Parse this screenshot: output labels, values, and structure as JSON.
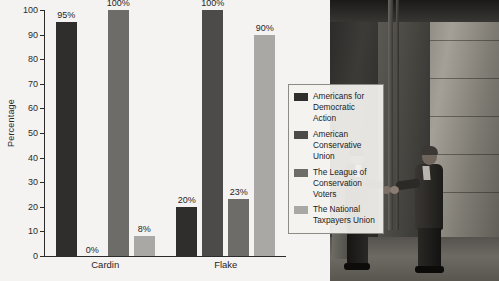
{
  "chart_data": {
    "type": "bar",
    "title": "",
    "xlabel": "",
    "ylabel": "Percentage",
    "ylim": [
      0,
      100
    ],
    "yticks": [
      0,
      10,
      20,
      30,
      40,
      50,
      60,
      70,
      80,
      90,
      100
    ],
    "grid": false,
    "legend_position": "right",
    "categories": [
      "Cardin",
      "Flake"
    ],
    "series": [
      {
        "name": "Americans for Democratic Action",
        "values": [
          95,
          20
        ],
        "labels": [
          "95%",
          "20%"
        ],
        "color": "#2f2e2c"
      },
      {
        "name": "American Conservative Union",
        "values": [
          0,
          100
        ],
        "labels": [
          "0%",
          "100%"
        ],
        "color": "#4c4b49"
      },
      {
        "name": "The League of Conservation Voters",
        "values": [
          100,
          23
        ],
        "labels": [
          "100%",
          "23%"
        ],
        "color": "#6d6c69"
      },
      {
        "name": "The National Taxpayers Union",
        "values": [
          8,
          90
        ],
        "labels": [
          "8%",
          "90%"
        ],
        "color": "#a9a8a4"
      }
    ]
  },
  "legend": {
    "items": [
      {
        "label": "Americans for Democratic Action",
        "color": "#2f2e2c"
      },
      {
        "label": "American Conservative Union",
        "color": "#4c4b49"
      },
      {
        "label": "The League of Conservation Voters",
        "color": "#6d6c69"
      },
      {
        "label": "The National Taxpayers Union",
        "color": "#a9a8a4"
      }
    ]
  },
  "photo": {
    "alt": "Two men in suits shaking hands outside a columned stone building"
  },
  "caption": {
    "text": ""
  }
}
